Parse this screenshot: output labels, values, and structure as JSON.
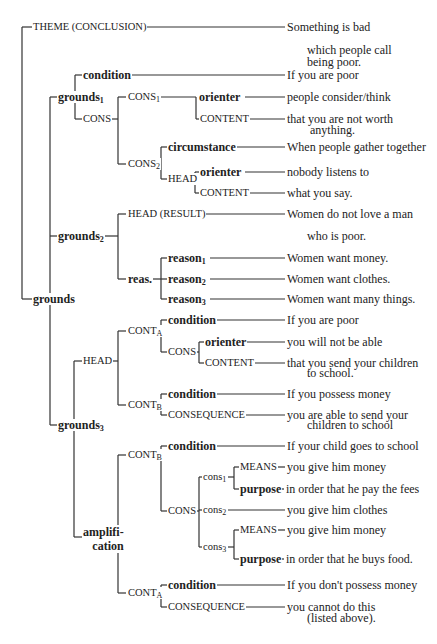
{
  "diagram": {
    "type": "rhetorical-structure-tree",
    "nodes": {
      "theme": {
        "label": "THEME (CONCLUSION)",
        "text": "Something is bad",
        "text_cont": "which people call",
        "text_cont2": "being poor."
      },
      "grounds": {
        "label": "grounds"
      },
      "grounds1": {
        "label": "grounds",
        "sub": "1",
        "condition": {
          "label": "condition",
          "text": "If you are poor"
        },
        "cons": {
          "label": "CONS",
          "cons1": {
            "label": "CONS",
            "sub": "1",
            "orienter": {
              "label": "orienter",
              "text": "people consider/think"
            },
            "content": {
              "label": "CONTENT",
              "text": "that you are not worth",
              "text_cont": "anything."
            }
          },
          "cons2": {
            "label": "CONS",
            "sub": "2",
            "circumstance": {
              "label": "circumstance",
              "text": "When people gather together"
            },
            "head": {
              "label": "HEAD",
              "orienter": {
                "label": "orienter",
                "text": "nobody listens to"
              },
              "content": {
                "label": "CONTENT",
                "text": "what you say."
              }
            }
          }
        }
      },
      "grounds2": {
        "label": "grounds",
        "sub": "2",
        "head_result": {
          "label": "HEAD (RESULT)",
          "text": "Women do not love a man",
          "text_cont": "who is poor."
        },
        "reas": {
          "label": "reas.",
          "reason1": {
            "label": "reason",
            "sub": "1",
            "text": "Women want money."
          },
          "reason2": {
            "label": "reason",
            "sub": "2",
            "text": "Women want clothes."
          },
          "reason3": {
            "label": "reason",
            "sub": "3",
            "text": "Women want many things."
          }
        }
      },
      "grounds3": {
        "label": "grounds",
        "sub": "3",
        "head": {
          "label": "HEAD",
          "contA": {
            "label": "CONT",
            "sub": "A",
            "condition": {
              "label": "condition",
              "text": "If you are poor"
            },
            "cons": {
              "label": "CONS",
              "orienter": {
                "label": "orienter",
                "text": "you will not be able"
              },
              "content": {
                "label": "CONTENT",
                "text": "that you send your children",
                "text_cont": "to school."
              }
            }
          },
          "contB": {
            "label": "CONT",
            "sub": "B",
            "condition": {
              "label": "condition",
              "text": "If you possess money"
            },
            "consequence": {
              "label": "CONSEQUENCE",
              "text": "you are able to send your",
              "text_cont": "children to school"
            }
          }
        },
        "amplification": {
          "label": "amplifi-",
          "label2": "cation",
          "contB": {
            "label": "CONT",
            "sub": "B",
            "condition": {
              "label": "condition",
              "text": "If your child goes to school"
            },
            "cons": {
              "label": "CONS",
              "cons1": {
                "label": "cons",
                "sub": "1",
                "means": {
                  "label": "MEANS",
                  "text": "you give him money"
                },
                "purpose": {
                  "label": "purpose",
                  "text": "in order that he pay the fees"
                }
              },
              "cons2": {
                "label": "cons",
                "sub": "2",
                "text": "you give him clothes"
              },
              "cons3": {
                "label": "cons",
                "sub": "3",
                "means": {
                  "label": "MEANS",
                  "text": "you give him money"
                },
                "purpose": {
                  "label": "purpose",
                  "text": "in order that he buys food."
                }
              }
            }
          },
          "contA": {
            "label": "CONT",
            "sub": "A",
            "condition": {
              "label": "condition",
              "text": "If you don't possess money"
            },
            "consequence": {
              "label": "CONSEQUENCE",
              "text": "you cannot do this",
              "text_cont": "(listed above)."
            }
          }
        }
      }
    }
  }
}
